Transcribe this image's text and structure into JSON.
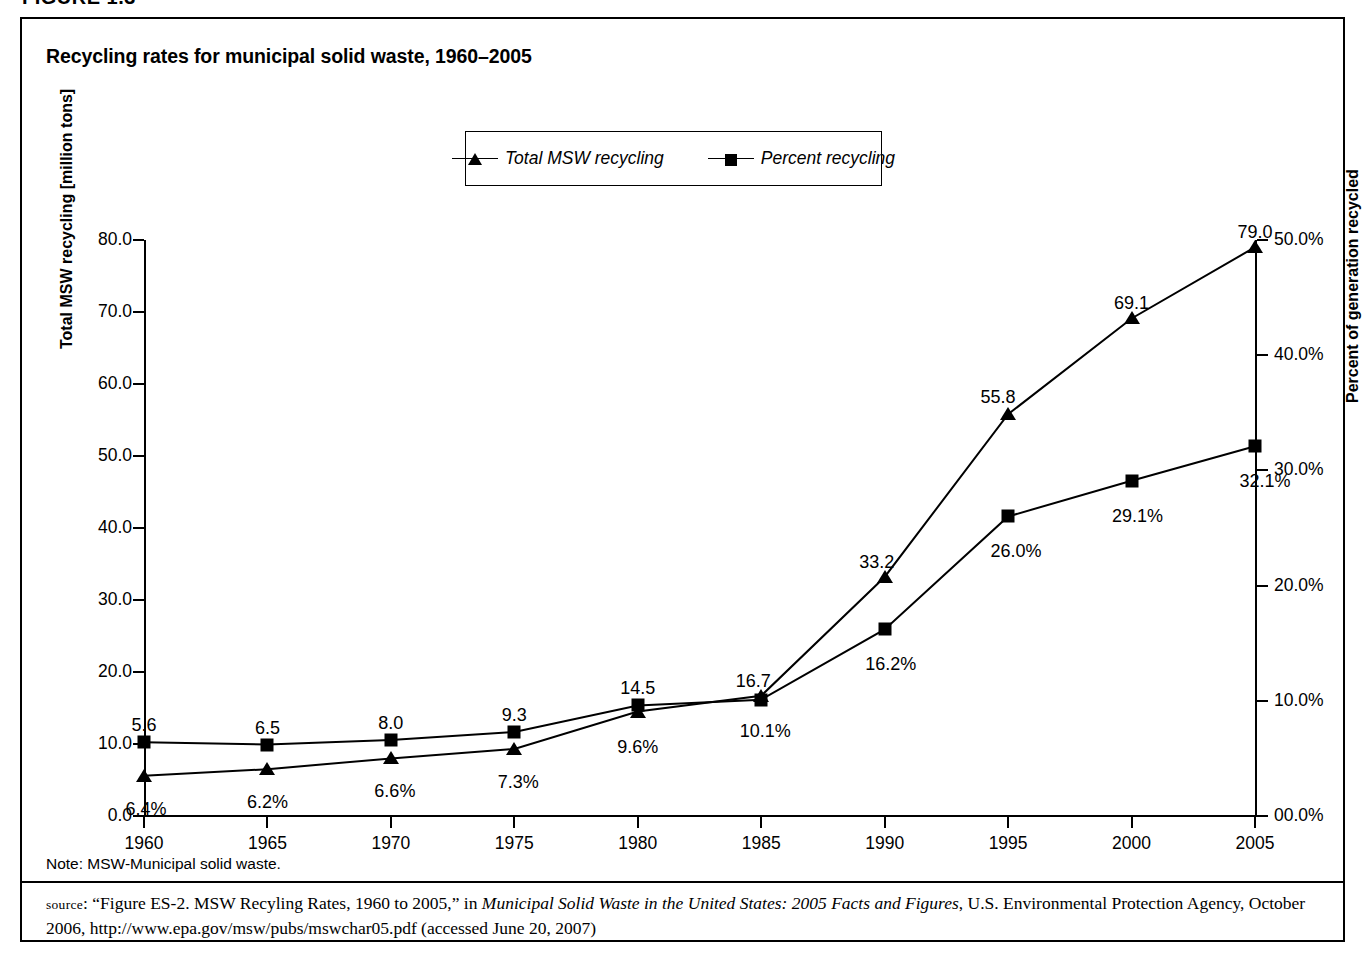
{
  "figure_header": "FIGURE 1.3",
  "chart_title": "Recycling rates for municipal solid waste, 1960–2005",
  "note": "Note: MSW-Municipal solid waste.",
  "source": {
    "label": "source",
    "colon": ": ",
    "part1": "“Figure ES-2. MSW Recyling Rates, 1960 to 2005,” in ",
    "italic1": "Municipal Solid Waste in the United States: 2005 Facts and Figures",
    "part2": ", U.S. Environmental Protection Agency, October 2006, http://www.epa.gov/msw/pubs/mswchar05.pdf (accessed June 20, 2007)"
  },
  "legend": {
    "entries": [
      {
        "label": "Total MSW recycling",
        "marker": "triangle-marker-icon"
      },
      {
        "label": "Percent recycling",
        "marker": "square-marker-icon"
      }
    ]
  },
  "chart_data": {
    "type": "line",
    "title": "Recycling rates for municipal solid waste, 1960–2005",
    "xlabel": "",
    "ylabel": "Total MSW recycling [million tons]",
    "y2label": "Percent of generation recycled",
    "grid": false,
    "legend_position": "top-center",
    "x": [
      1960,
      1965,
      1970,
      1975,
      1980,
      1985,
      1990,
      1995,
      2000,
      2005
    ],
    "xtick_labels": [
      "1960",
      "1965",
      "1970",
      "1975",
      "1980",
      "1985",
      "1990",
      "1995",
      "2000",
      "2005"
    ],
    "xlim": [
      1960,
      2005
    ],
    "ylim": [
      0.0,
      80.0
    ],
    "ytick_labels": [
      "0.0",
      "10.0",
      "20.0",
      "30.0",
      "40.0",
      "50.0",
      "60.0",
      "70.0",
      "80.0"
    ],
    "yticks": [
      0,
      10,
      20,
      30,
      40,
      50,
      60,
      70,
      80
    ],
    "y2lim": [
      0.0,
      50.0
    ],
    "y2tick_labels": [
      "00.0%",
      "10.0%",
      "20.0%",
      "30.0%",
      "40.0%",
      "50.0%"
    ],
    "y2ticks": [
      0,
      10,
      20,
      30,
      40,
      50
    ],
    "series": [
      {
        "name": "Total MSW recycling",
        "marker": "triangle",
        "axis": "left",
        "units": "million tons",
        "values": [
          5.6,
          6.5,
          8.0,
          9.3,
          14.5,
          16.7,
          33.2,
          55.8,
          69.1,
          79.0
        ],
        "data_labels": [
          "5.6",
          "6.5",
          "8.0",
          "9.3",
          "14.5",
          "16.7",
          "33.2",
          "55.8",
          "69.1",
          "79.0"
        ]
      },
      {
        "name": "Percent recycling",
        "marker": "square",
        "axis": "right",
        "units": "percent",
        "values": [
          6.4,
          6.2,
          6.6,
          7.3,
          9.6,
          10.1,
          16.2,
          26.0,
          29.1,
          32.1
        ],
        "data_labels": [
          "6.4%",
          "6.2%",
          "6.6%",
          "7.3%",
          "9.6%",
          "10.1%",
          "16.2%",
          "26.0%",
          "29.1%",
          "32.1%"
        ]
      }
    ]
  },
  "colors": {
    "ink": "#000000",
    "background": "#ffffff"
  }
}
